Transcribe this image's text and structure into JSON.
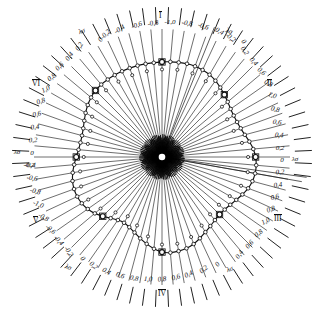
{
  "figure": {
    "title": "",
    "axis_symbol": "λσ",
    "center_label": ""
  },
  "chart_data": {
    "type": "line",
    "title": "",
    "subtitle": "",
    "xlabel": "",
    "ylabel": "",
    "grid": false,
    "legend_position": "none",
    "coordinate_system": "polar",
    "sector_count": 6,
    "sector_labels": [
      "I",
      "II",
      "III",
      "IV",
      "V",
      "VI"
    ],
    "axis_label": "λσ",
    "radial_tick_count": 72,
    "marker": "open-circle",
    "scale_max": 1.0,
    "scale_step": 0.2,
    "radial_tick_values": [
      0,
      0.2,
      0.4,
      0.6,
      0.8,
      1.0,
      0.8,
      0.6,
      0.4,
      0.2,
      0
    ],
    "note": "closed rounded-triangular polar curve with circular data markers at each radial spoke",
    "theta_deg": [
      0,
      5,
      10,
      15,
      20,
      25,
      30,
      35,
      40,
      45,
      50,
      55,
      60,
      65,
      70,
      75,
      80,
      85,
      90,
      95,
      100,
      105,
      110,
      115,
      120,
      125,
      130,
      135,
      140,
      145,
      150,
      155,
      160,
      165,
      170,
      175,
      180,
      185,
      190,
      195,
      200,
      205,
      210,
      215,
      220,
      225,
      230,
      235,
      240,
      245,
      250,
      255,
      260,
      265,
      270,
      275,
      280,
      285,
      290,
      295,
      300,
      305,
      310,
      315,
      320,
      325,
      330,
      335,
      340,
      345,
      350,
      355
    ],
    "r_values": [
      0.97,
      0.975,
      0.98,
      0.985,
      0.985,
      0.98,
      0.97,
      0.95,
      0.925,
      0.9,
      0.875,
      0.855,
      0.845,
      0.845,
      0.855,
      0.875,
      0.905,
      0.935,
      0.955,
      0.965,
      0.965,
      0.955,
      0.935,
      0.905,
      0.875,
      0.85,
      0.835,
      0.83,
      0.84,
      0.86,
      0.885,
      0.915,
      0.945,
      0.965,
      0.975,
      0.98,
      0.97,
      0.94,
      0.9,
      0.86,
      0.82,
      0.79,
      0.775,
      0.785,
      0.815,
      0.855,
      0.895,
      0.925,
      0.945,
      0.955,
      0.955,
      0.945,
      0.925,
      0.9,
      0.875,
      0.855,
      0.845,
      0.845,
      0.855,
      0.875,
      0.9,
      0.925,
      0.945,
      0.96,
      0.965,
      0.965,
      0.965,
      0.965,
      0.965,
      0.965,
      0.965,
      0.965
    ],
    "scales": [
      {
        "sector": "I",
        "position": "top",
        "labels": [
          "λσ",
          "0",
          "-0,2",
          "-0,4",
          "-0,6",
          "-0,8",
          "-1,0",
          "-0,8",
          "-0,6",
          "-0,4",
          "-0,2",
          "0",
          "λσ"
        ]
      },
      {
        "sector": "II",
        "position": "upper-right",
        "labels": [
          "0,2",
          "0,4",
          "0,6",
          "0,8",
          "1,0",
          "0,8",
          "0,6",
          "0,4",
          "0,2"
        ]
      },
      {
        "sector": "III",
        "position": "lower-right",
        "labels": [
          "0",
          "0,2",
          "0,4",
          "0,6",
          "0,8",
          "1,0",
          "0,8",
          "0,6",
          "0,4",
          "0,2",
          "0"
        ]
      },
      {
        "sector": "IV",
        "position": "bottom",
        "labels": [
          "λσ",
          "0",
          "0,2",
          "0,4",
          "0,6",
          "0,8",
          "1,0",
          "0,8",
          "0,6",
          "0,4",
          "0,2",
          "0",
          "λσ"
        ]
      },
      {
        "sector": "V",
        "position": "lower-left",
        "labels": [
          "0",
          "-0,2",
          "-0,4",
          "-0,6",
          "-0,8",
          "-1,0",
          "-0,8",
          "-0,6",
          "-0,4",
          "-0,2"
        ]
      },
      {
        "sector": "VI",
        "position": "upper-left",
        "labels": [
          "0,2",
          "0,4",
          "0,6",
          "0,8",
          "1,0",
          "0,8",
          "0,6",
          "0,4",
          "0,2"
        ]
      }
    ]
  },
  "labels": {
    "top_row": [
      {
        "t": "λσ",
        "x": 82,
        "y": 32,
        "rot": -22
      },
      {
        "t": "0",
        "x": 101,
        "y": 40,
        "rot": -52
      },
      {
        "t": "-0,2",
        "x": 106,
        "y": 35,
        "rot": -44
      },
      {
        "t": "-0,4",
        "x": 120,
        "y": 30,
        "rot": -32
      },
      {
        "t": "-0,6",
        "x": 137,
        "y": 26,
        "rot": -20
      },
      {
        "t": "-0,8",
        "x": 153,
        "y": 24,
        "rot": -10
      },
      {
        "t": "-1,0",
        "x": 170,
        "y": 23,
        "rot": 0
      },
      {
        "t": "-0,8",
        "x": 187,
        "y": 24,
        "rot": 8
      },
      {
        "t": "-0,6",
        "x": 203,
        "y": 27,
        "rot": 18
      },
      {
        "t": "0,4",
        "x": 219,
        "y": 32,
        "rot": 28
      },
      {
        "t": "-0,2",
        "x": 230,
        "y": 38,
        "rot": 38
      },
      {
        "t": "0",
        "x": 243,
        "y": 42,
        "rot": 50
      },
      {
        "t": "λσ",
        "x": 229,
        "y": 32,
        "rot": 20
      }
    ],
    "right_upper": [
      {
        "t": "0,2",
        "x": 244,
        "y": 51,
        "rot": 56
      },
      {
        "t": "0,4",
        "x": 253,
        "y": 62,
        "rot": 48
      },
      {
        "t": "0,6",
        "x": 261,
        "y": 72,
        "rot": 40
      },
      {
        "t": "0,8",
        "x": 268,
        "y": 84,
        "rot": 30
      },
      {
        "t": "1,0",
        "x": 272,
        "y": 96,
        "rot": 20
      },
      {
        "t": "0,8",
        "x": 275,
        "y": 110,
        "rot": 14
      },
      {
        "t": "0,6",
        "x": 277,
        "y": 123,
        "rot": 8
      },
      {
        "t": "0,4",
        "x": 279,
        "y": 136,
        "rot": 4
      },
      {
        "t": "0,2",
        "x": 280,
        "y": 149,
        "rot": 0
      }
    ],
    "right_mid": [
      {
        "t": "0",
        "x": 282,
        "y": 161,
        "rot": 0
      },
      {
        "t": "λσ",
        "x": 295,
        "y": 160,
        "rot": 0
      }
    ],
    "right_lower": [
      {
        "t": "0,2",
        "x": 280,
        "y": 173,
        "rot": -4
      },
      {
        "t": "0,4",
        "x": 278,
        "y": 186,
        "rot": -8
      },
      {
        "t": "0,6",
        "x": 275,
        "y": 198,
        "rot": -14
      },
      {
        "t": "0,8",
        "x": 271,
        "y": 210,
        "rot": -20
      },
      {
        "t": "1,0",
        "x": 266,
        "y": 222,
        "rot": -28
      },
      {
        "t": "0,8",
        "x": 259,
        "y": 234,
        "rot": -38
      },
      {
        "t": "0,6",
        "x": 250,
        "y": 245,
        "rot": -46
      },
      {
        "t": "0,4",
        "x": 240,
        "y": 255,
        "rot": -54
      }
    ],
    "bottom_row": [
      {
        "t": "λσ",
        "x": 230,
        "y": 270,
        "rot": -22
      },
      {
        "t": "0",
        "x": 218,
        "y": 265,
        "rot": -48
      },
      {
        "t": "0,2",
        "x": 204,
        "y": 270,
        "rot": -38
      },
      {
        "t": "0,4",
        "x": 189,
        "y": 275,
        "rot": -26
      },
      {
        "t": "0,6",
        "x": 176,
        "y": 278,
        "rot": -16
      },
      {
        "t": "0,8",
        "x": 162,
        "y": 280,
        "rot": -7
      },
      {
        "t": "1,0",
        "x": 148,
        "y": 280,
        "rot": 2
      },
      {
        "t": "0,8",
        "x": 134,
        "y": 279,
        "rot": 10
      },
      {
        "t": "0,6",
        "x": 120,
        "y": 276,
        "rot": 20
      },
      {
        "t": "0,4",
        "x": 106,
        "y": 272,
        "rot": 30
      },
      {
        "t": "0,2",
        "x": 93,
        "y": 266,
        "rot": 40
      },
      {
        "t": "0",
        "x": 82,
        "y": 259,
        "rot": 50
      },
      {
        "t": "λσ",
        "x": 68,
        "y": 268,
        "rot": 22
      }
    ],
    "left_lower": [
      {
        "t": "-0,2",
        "x": 68,
        "y": 252,
        "rot": 56
      },
      {
        "t": "-0,4",
        "x": 58,
        "y": 241,
        "rot": 48
      },
      {
        "t": "-0,6",
        "x": 50,
        "y": 230,
        "rot": 40
      },
      {
        "t": "-0,8",
        "x": 43,
        "y": 218,
        "rot": 30
      },
      {
        "t": "-1,0",
        "x": 38,
        "y": 205,
        "rot": 22
      },
      {
        "t": "-0,8",
        "x": 35,
        "y": 192,
        "rot": 14
      },
      {
        "t": "-0,6",
        "x": 32,
        "y": 179,
        "rot": 8
      },
      {
        "t": "-0,4",
        "x": 30,
        "y": 166,
        "rot": 3
      }
    ],
    "left_mid": [
      {
        "t": "0",
        "x": 32,
        "y": 154,
        "rot": 0
      },
      {
        "t": "λσ",
        "x": 17,
        "y": 153,
        "rot": 0
      },
      {
        "t": "-0,2",
        "x": 29,
        "y": 166,
        "rot": 0
      }
    ],
    "left_upper": [
      {
        "t": "0,2",
        "x": 33,
        "y": 141,
        "rot": -3
      },
      {
        "t": "0,4",
        "x": 35,
        "y": 128,
        "rot": -6
      },
      {
        "t": "0,6",
        "x": 37,
        "y": 115,
        "rot": -12
      },
      {
        "t": "0,8",
        "x": 41,
        "y": 102,
        "rot": -18
      },
      {
        "t": "1,0",
        "x": 46,
        "y": 90,
        "rot": -26
      },
      {
        "t": "0,8",
        "x": 52,
        "y": 78,
        "rot": -36
      },
      {
        "t": "0,6",
        "x": 60,
        "y": 67,
        "rot": -44
      },
      {
        "t": "0,4",
        "x": 70,
        "y": 57,
        "rot": -52
      },
      {
        "t": "0,2",
        "x": 80,
        "y": 47,
        "rot": -58
      }
    ],
    "romans": [
      {
        "t": "I",
        "x": 159,
        "y": 11
      },
      {
        "t": "II",
        "x": 267,
        "y": 79
      },
      {
        "t": "III",
        "x": 274,
        "y": 214
      },
      {
        "t": "IV",
        "x": 158,
        "y": 289
      },
      {
        "t": "V",
        "x": 33,
        "y": 216
      },
      {
        "t": "VI",
        "x": 32,
        "y": 79
      }
    ]
  }
}
